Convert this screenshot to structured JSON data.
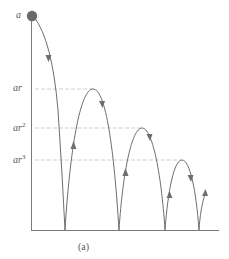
{
  "figure": {
    "caption": "(a)",
    "colors": {
      "curve": "#6e6e6e",
      "ball": "#6a6a6a",
      "axis": "#707070",
      "dashed": "#bdbdbd",
      "label": "#5a5a5a"
    }
  },
  "labels": {
    "a": {
      "base": "a",
      "exp": ""
    },
    "ar": {
      "base": "ar",
      "exp": ""
    },
    "ar2": {
      "base": "ar",
      "exp": "2"
    },
    "ar3": {
      "base": "ar",
      "exp": "3"
    }
  },
  "heights": [
    {
      "name": "a",
      "y": 16
    },
    {
      "name": "ar",
      "y": 89
    },
    {
      "name": "ar^2",
      "y": 128
    },
    {
      "name": "ar^3",
      "y": 160
    }
  ],
  "bounces": [
    {
      "ground_x": 65
    },
    {
      "ground_x": 119
    },
    {
      "ground_x": 165
    },
    {
      "ground_x": 199
    }
  ]
}
